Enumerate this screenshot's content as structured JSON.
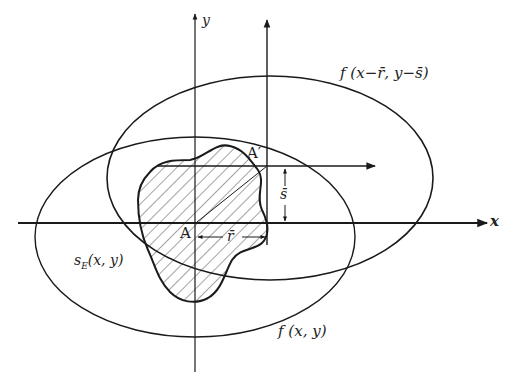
{
  "figure": {
    "axes": {
      "x_label": "x",
      "y_label": "y"
    },
    "curves": {
      "original_label": "f (x, y)",
      "shifted_label": "f (x−r̄, y−s̄)",
      "region_label": "sE(x, y)",
      "region_label_base": "s",
      "region_label_sub": "E",
      "region_label_args": "(x, y)"
    },
    "points": {
      "origin_point": "A",
      "shifted_point": "A′"
    },
    "offsets": {
      "horizontal_shift": "r̄",
      "vertical_shift": "s̄"
    },
    "colors": {
      "stroke": "#1a1a1a",
      "background": "#ffffff"
    }
  }
}
